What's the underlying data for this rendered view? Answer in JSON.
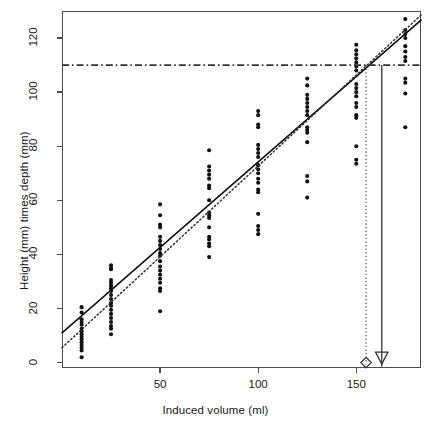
{
  "figure": {
    "plot_area": {
      "left": 62,
      "top": 11,
      "right": 421,
      "bottom": 368
    }
  },
  "axes": {
    "x_title": "Induced volume (ml)",
    "y_title": "Height (mm) times depth (mm)",
    "x_ticks": [
      "50",
      "100",
      "150"
    ],
    "y_ticks": [
      "0",
      "20",
      "40",
      "60",
      "80",
      "100",
      "120"
    ]
  },
  "colors": {
    "point": "#111111",
    "frame": "#4d4d4d",
    "fit_solid": "#111111",
    "fit_dotted": "#333333",
    "reference": "#333333"
  },
  "annotations": {
    "reference_line_label": "110",
    "diamond_marker": "open-diamond",
    "triangle_marker": "open-triangle-down",
    "diamond_x_value": "155",
    "triangle_x_value": "163"
  },
  "chart_data": {
    "type": "scatter",
    "title": "",
    "xlabel": "Induced volume (ml)",
    "ylabel": "Height (mm) times depth (mm)",
    "xlim": [
      0,
      183
    ],
    "ylim": [
      -2,
      130
    ],
    "xticks": [
      50,
      100,
      150
    ],
    "yticks": [
      0,
      20,
      40,
      60,
      80,
      100,
      120
    ],
    "grid": false,
    "legend": "none",
    "series": [
      {
        "name": "observations",
        "marker": "filled-circle",
        "points": [
          [
            10,
            20.5
          ],
          [
            10,
            18.5
          ],
          [
            10,
            16.0
          ],
          [
            10,
            15.0
          ],
          [
            10,
            14.0
          ],
          [
            10,
            12.5
          ],
          [
            10,
            11.5
          ],
          [
            10,
            10.5
          ],
          [
            10,
            9.5
          ],
          [
            10,
            8.5
          ],
          [
            10,
            7.5
          ],
          [
            10,
            6.5
          ],
          [
            10,
            5.5
          ],
          [
            10,
            4.5
          ],
          [
            10,
            2.0
          ],
          [
            25,
            36.0
          ],
          [
            25,
            35.0
          ],
          [
            25,
            34.5
          ],
          [
            25,
            30.5
          ],
          [
            25,
            29.5
          ],
          [
            25,
            28.5
          ],
          [
            25,
            27.5
          ],
          [
            25,
            26.5
          ],
          [
            25,
            25.0
          ],
          [
            25,
            23.5
          ],
          [
            25,
            22.0
          ],
          [
            25,
            21.0
          ],
          [
            25,
            19.5
          ],
          [
            25,
            18.0
          ],
          [
            25,
            16.5
          ],
          [
            25,
            15.0
          ],
          [
            25,
            13.5
          ],
          [
            25,
            12.5
          ],
          [
            25,
            10.5
          ],
          [
            50,
            58.5
          ],
          [
            50,
            54.5
          ],
          [
            50,
            51.0
          ],
          [
            50,
            50.0
          ],
          [
            50,
            46.5
          ],
          [
            50,
            45.0
          ],
          [
            50,
            43.5
          ],
          [
            50,
            42.0
          ],
          [
            50,
            40.5
          ],
          [
            50,
            39.5
          ],
          [
            50,
            37.5
          ],
          [
            50,
            35.5
          ],
          [
            50,
            34.0
          ],
          [
            50,
            32.5
          ],
          [
            50,
            31.0
          ],
          [
            50,
            29.5
          ],
          [
            50,
            27.5
          ],
          [
            50,
            26.5
          ],
          [
            50,
            19.0
          ],
          [
            75,
            78.5
          ],
          [
            75,
            72.5
          ],
          [
            75,
            71.0
          ],
          [
            75,
            69.5
          ],
          [
            75,
            68.0
          ],
          [
            75,
            65.5
          ],
          [
            75,
            64.5
          ],
          [
            75,
            60.0
          ],
          [
            75,
            55.5
          ],
          [
            75,
            54.5
          ],
          [
            75,
            53.5
          ],
          [
            75,
            50.0
          ],
          [
            75,
            46.5
          ],
          [
            75,
            45.5
          ],
          [
            75,
            44.0
          ],
          [
            75,
            43.0
          ],
          [
            75,
            39.0
          ],
          [
            100,
            93.0
          ],
          [
            100,
            91.5
          ],
          [
            100,
            88.0
          ],
          [
            100,
            87.0
          ],
          [
            100,
            80.5
          ],
          [
            100,
            79.0
          ],
          [
            100,
            77.5
          ],
          [
            100,
            76.0
          ],
          [
            100,
            73.0
          ],
          [
            100,
            71.5
          ],
          [
            100,
            70.0
          ],
          [
            100,
            68.0
          ],
          [
            100,
            66.5
          ],
          [
            100,
            64.0
          ],
          [
            100,
            63.0
          ],
          [
            100,
            55.0
          ],
          [
            100,
            50.5
          ],
          [
            100,
            49.0
          ],
          [
            100,
            47.5
          ],
          [
            125,
            105.0
          ],
          [
            125,
            102.5
          ],
          [
            125,
            99.0
          ],
          [
            125,
            97.5
          ],
          [
            125,
            96.0
          ],
          [
            125,
            94.5
          ],
          [
            125,
            93.0
          ],
          [
            125,
            91.5
          ],
          [
            125,
            87.0
          ],
          [
            125,
            86.0
          ],
          [
            125,
            85.0
          ],
          [
            125,
            81.5
          ],
          [
            125,
            69.0
          ],
          [
            125,
            67.0
          ],
          [
            125,
            61.0
          ],
          [
            150,
            117.5
          ],
          [
            150,
            115.5
          ],
          [
            150,
            114.0
          ],
          [
            150,
            112.5
          ],
          [
            150,
            111.0
          ],
          [
            150,
            109.5
          ],
          [
            150,
            108.0
          ],
          [
            150,
            103.0
          ],
          [
            150,
            101.5
          ],
          [
            150,
            100.0
          ],
          [
            150,
            98.5
          ],
          [
            150,
            96.0
          ],
          [
            150,
            94.5
          ],
          [
            150,
            91.5
          ],
          [
            150,
            90.5
          ],
          [
            150,
            80.0
          ],
          [
            150,
            75.0
          ],
          [
            150,
            73.5
          ],
          [
            175,
            127.0
          ],
          [
            175,
            123.0
          ],
          [
            175,
            121.5
          ],
          [
            175,
            120.0
          ],
          [
            175,
            117.0
          ],
          [
            175,
            115.0
          ],
          [
            175,
            113.0
          ],
          [
            175,
            111.5
          ],
          [
            175,
            105.0
          ],
          [
            175,
            103.5
          ],
          [
            175,
            99.5
          ],
          [
            175,
            87.0
          ]
        ]
      }
    ],
    "fit_lines": [
      {
        "name": "solid-regression",
        "style": "solid",
        "intercept": 11.0,
        "slope": 0.632,
        "x_range": [
          0,
          183
        ]
      },
      {
        "name": "dotted-regression",
        "style": "dotted",
        "intercept": 5.5,
        "slope": 0.672,
        "x_range": [
          0,
          183
        ]
      }
    ],
    "reference_lines": [
      {
        "name": "threshold",
        "orientation": "horizontal",
        "style": "dashdot",
        "value": 110
      },
      {
        "name": "dotted-drop",
        "orientation": "vertical",
        "style": "dotted",
        "value": 155,
        "y_from": 110,
        "y_to": 0
      },
      {
        "name": "solid-drop-arrow",
        "orientation": "vertical",
        "style": "solid",
        "value": 163,
        "y_from": 110,
        "y_to": 0
      }
    ]
  }
}
